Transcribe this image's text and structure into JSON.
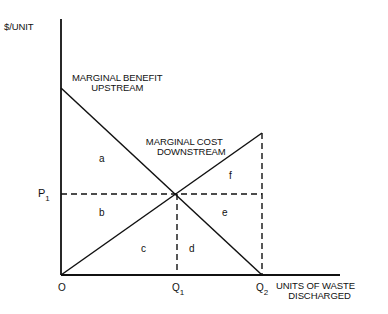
{
  "diagram": {
    "y_axis_label": "$/UNIT",
    "x_axis_label_line1": "UNITS OF WASTE",
    "x_axis_label_line2": "DISCHARGED",
    "curves": [
      {
        "name": "Marginal Benefit Upstream",
        "line1": "MARGINAL BENEFIT",
        "line2": "UPSTREAM",
        "from": [
          61,
          88
        ],
        "to": [
          262,
          275
        ]
      },
      {
        "name": "Marginal Cost Downstream",
        "line1": "MARGINAL COST",
        "line2": "DOWNSTREAM",
        "from": [
          61,
          275
        ],
        "to": [
          262,
          133
        ]
      }
    ],
    "price_label": "P",
    "price_sub": "1",
    "origin_label": "O",
    "q1_label": "Q",
    "q1_sub": "1",
    "q2_label": "Q",
    "q2_sub": "2",
    "regions": [
      "a",
      "b",
      "c",
      "d",
      "e",
      "f"
    ],
    "colors": {
      "ink": "#111111",
      "background": "#ffffff"
    }
  }
}
